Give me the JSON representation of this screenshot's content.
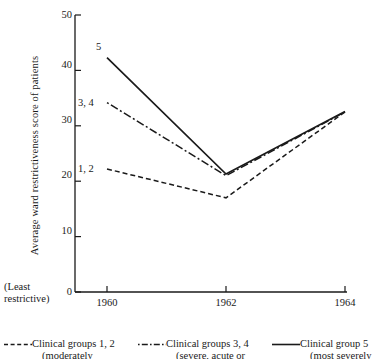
{
  "chart_data": {
    "type": "line",
    "title": "",
    "xlabel": "",
    "ylabel": "Average ward restrictiveness score of patients",
    "x": [
      1960,
      1962,
      1964
    ],
    "xticklabels": [
      "1960",
      "1962",
      "1964"
    ],
    "xlim": [
      1959.6,
      1964.4
    ],
    "ylim": [
      0,
      50
    ],
    "yticks": [
      0,
      10,
      20,
      30,
      40,
      50
    ],
    "yticklabels": [
      "0",
      "10",
      "20",
      "30",
      "40",
      "50"
    ],
    "grid": false,
    "legend_position": "bottom",
    "axis_note": "(Least restrictive)",
    "axis_note_lines": [
      "(Least",
      "restrictive)"
    ],
    "series": [
      {
        "name": "Clinical groups 1, 2",
        "sublabel": "(moderately",
        "tag": "1, 2",
        "style": "dashed",
        "color": "#1a1a1a",
        "values": [
          22.2,
          17.0,
          32.5
        ]
      },
      {
        "name": "Clinical groups 3, 4",
        "sublabel": "(severe, acute or",
        "tag": "3, 4",
        "style": "dash-dot",
        "color": "#1a1a1a",
        "values": [
          34.2,
          21.0,
          32.5
        ]
      },
      {
        "name": "Clinical group 5",
        "sublabel": "(most severely at",
        "tag": "5",
        "style": "solid",
        "color": "#1a1a1a",
        "values": [
          42.3,
          21.3,
          32.6
        ]
      }
    ]
  },
  "legend": {
    "items": [
      {
        "label": "Clinical groups 1, 2",
        "sublabel": "(moderately",
        "style": "dashed"
      },
      {
        "label": "Clinical groups 3, 4",
        "sublabel": "(severe, acute or",
        "style": "dash-dot"
      },
      {
        "label": "Clinical group 5",
        "sublabel": "(most severely at",
        "style": "solid"
      }
    ]
  }
}
